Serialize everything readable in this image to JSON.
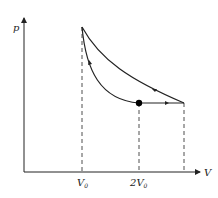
{
  "diagram": {
    "type": "p-V thermodynamic cycle",
    "axes": {
      "y_label": "p",
      "x_label": "V"
    },
    "ticks": [
      {
        "base": "V",
        "sub": "0",
        "prefix": ""
      },
      {
        "base": "V",
        "sub": "0",
        "prefix": "2"
      }
    ],
    "points": {
      "top_vertex": "V0 (max pressure)",
      "marked_state": "2V0 (black dot)",
      "right_vertex": "max volume"
    },
    "paths": [
      {
        "name": "isobaric expansion",
        "from": "marked_state",
        "to": "right_vertex",
        "arrow": "right"
      },
      {
        "name": "upper curve",
        "from": "right_vertex",
        "to": "top_vertex",
        "arrow": "up-left"
      },
      {
        "name": "lower curve",
        "from": "top_vertex",
        "to": "marked_state",
        "arrow": "down"
      }
    ],
    "colors": {
      "line": "#222222",
      "dot": "#000000"
    }
  }
}
